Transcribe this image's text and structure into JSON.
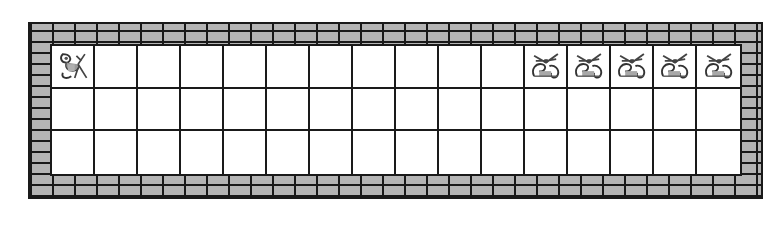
{
  "game": {
    "title": "",
    "grid": {
      "rows": 3,
      "cols": 16
    },
    "wall": {
      "style": "brick",
      "color": "#b5b5b5",
      "mortar": "#1a1a1a"
    },
    "entities": [
      {
        "type": "monkey",
        "row": 0,
        "col": 0,
        "icon": "monkey-icon"
      },
      {
        "type": "pig",
        "row": 0,
        "col": 11,
        "icon": "pig-icon"
      },
      {
        "type": "pig",
        "row": 0,
        "col": 12,
        "icon": "pig-icon"
      },
      {
        "type": "pig",
        "row": 0,
        "col": 13,
        "icon": "pig-icon"
      },
      {
        "type": "pig",
        "row": 0,
        "col": 14,
        "icon": "pig-icon"
      },
      {
        "type": "pig",
        "row": 0,
        "col": 15,
        "icon": "pig-icon"
      }
    ]
  }
}
